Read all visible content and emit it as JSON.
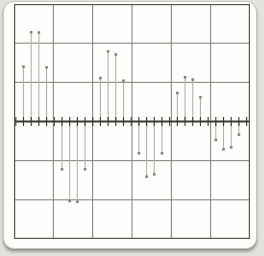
{
  "chart_data": {
    "type": "stem",
    "title": "",
    "xlabel": "",
    "ylabel": "",
    "x": [
      0,
      1,
      2,
      3,
      4,
      5,
      6,
      7,
      8,
      9,
      10,
      11,
      12,
      13,
      14,
      15,
      16,
      17,
      18,
      19,
      20,
      21,
      22,
      23,
      24,
      25,
      26,
      27,
      28,
      29,
      30
    ],
    "values": [
      0,
      1.4,
      2.28,
      2.27,
      1.38,
      0,
      -1.22,
      -2.03,
      -2.05,
      -1.22,
      0,
      1.11,
      1.79,
      1.71,
      1.04,
      0,
      -0.81,
      -1.41,
      -1.35,
      -0.81,
      0,
      0.73,
      1.13,
      1.07,
      0.62,
      0,
      -0.47,
      -0.71,
      -0.66,
      -0.34,
      0
    ],
    "xlim": [
      0,
      30
    ],
    "ylim": [
      -3,
      3
    ],
    "grid": {
      "on": true,
      "cols": 6,
      "rows": 6
    },
    "axis": {
      "position": "middle",
      "tick_every": 1,
      "tick_count": 31
    },
    "legend": "none",
    "annotations": []
  },
  "style": {
    "page_bg": "#e2e2df",
    "card_bg": "#fdfdfc",
    "card_border": "#c7c7c3",
    "frame_color": "#58584f",
    "grid_color": "#7d7d78",
    "axis_color": "#3a3a33",
    "tick_color": "#3a3a33",
    "stem_color": "#b2b2ad",
    "dot_color": "#83837d"
  }
}
